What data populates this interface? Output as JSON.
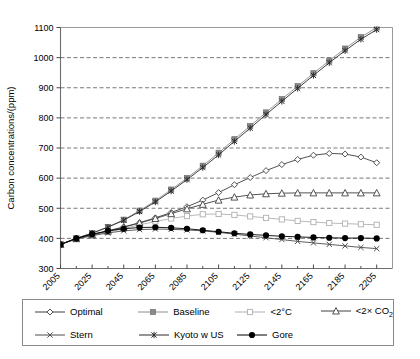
{
  "chart_data": {
    "type": "line",
    "title": "",
    "xlabel": "",
    "ylabel": "Carbon concentrations/(ppm)",
    "xlim": [
      2005,
      2215
    ],
    "ylim": [
      300,
      1100
    ],
    "ytick_step": 100,
    "grid": "horizontal dashed",
    "legend_position": "bottom-outside",
    "x": [
      2005,
      2015,
      2025,
      2035,
      2045,
      2055,
      2065,
      2075,
      2085,
      2095,
      2105,
      2115,
      2125,
      2135,
      2145,
      2155,
      2165,
      2175,
      2185,
      2195,
      2205
    ],
    "xticks": [
      2005,
      2025,
      2045,
      2065,
      2085,
      2105,
      2125,
      2145,
      2165,
      2185,
      2205
    ],
    "xtick_labels": [
      "2005",
      "2025",
      "2045",
      "2065",
      "2085",
      "2105",
      "2125",
      "2145",
      "2165",
      "2185",
      "2205"
    ],
    "yticks": [
      300,
      400,
      500,
      600,
      700,
      800,
      900,
      1000,
      1100
    ],
    "ytick_labels": [
      "300",
      "400",
      "500",
      "600",
      "700",
      "800",
      "900",
      "1000",
      "1100"
    ],
    "series": [
      {
        "name": "Optimal",
        "marker": "open-diamond",
        "color": "#404040",
        "values": [
          380,
          399,
          412,
          425,
          438,
          452,
          468,
          486,
          505,
          527,
          552,
          578,
          602,
          625,
          645,
          662,
          676,
          682,
          680,
          670,
          651
        ]
      },
      {
        "name": "Baseline",
        "marker": "filled-square",
        "color": "#8c8c8c",
        "values": [
          380,
          400,
          418,
          438,
          462,
          492,
          525,
          562,
          600,
          641,
          684,
          729,
          773,
          818,
          862,
          905,
          948,
          990,
          1030,
          1068,
          1100
        ]
      },
      {
        "name": "<2°C",
        "marker": "open-square",
        "color": "#b0b0b0",
        "values": [
          380,
          398,
          410,
          421,
          432,
          445,
          456,
          466,
          474,
          480,
          481,
          478,
          473,
          468,
          463,
          458,
          454,
          451,
          449,
          447,
          445
        ]
      },
      {
        "name": "<2× CO2",
        "marker": "open-triangle",
        "color": "#404040",
        "values": [
          380,
          399,
          412,
          424,
          437,
          451,
          466,
          482,
          498,
          513,
          527,
          537,
          544,
          548,
          550,
          551,
          551,
          551,
          551,
          551,
          551
        ]
      },
      {
        "name": "Stern",
        "marker": "cross-x",
        "color": "#4d4d4d",
        "values": [
          380,
          398,
          409,
          418,
          425,
          429,
          431,
          430,
          428,
          425,
          420,
          414,
          408,
          402,
          396,
          390,
          385,
          380,
          375,
          370,
          366
        ]
      },
      {
        "name": "Kyoto w US",
        "marker": "asterisk",
        "color": "#2b2b2b",
        "values": [
          380,
          400,
          417,
          437,
          460,
          489,
          521,
          557,
          595,
          635,
          677,
          722,
          766,
          811,
          855,
          898,
          941,
          983,
          1023,
          1061,
          1093
        ]
      },
      {
        "name": "Gore",
        "marker": "filled-circle",
        "color": "#000000",
        "values": [
          380,
          400,
          414,
          425,
          432,
          436,
          437,
          435,
          432,
          427,
          422,
          417,
          413,
          410,
          407,
          405,
          403,
          402,
          401,
          401,
          400
        ]
      }
    ]
  },
  "legend": {
    "rows": [
      [
        {
          "label": "Optimal",
          "marker": "open-diamond"
        },
        {
          "label": "Baseline",
          "marker": "filled-square"
        },
        {
          "label": "<2°C",
          "marker": "open-square"
        },
        {
          "label": "<2× CO",
          "sub": "2",
          "marker": "open-triangle"
        }
      ],
      [
        {
          "label": "Stern",
          "marker": "cross-x"
        },
        {
          "label": "Kyoto w US",
          "marker": "asterisk"
        },
        {
          "label": "Gore",
          "marker": "filled-circle"
        }
      ]
    ]
  }
}
